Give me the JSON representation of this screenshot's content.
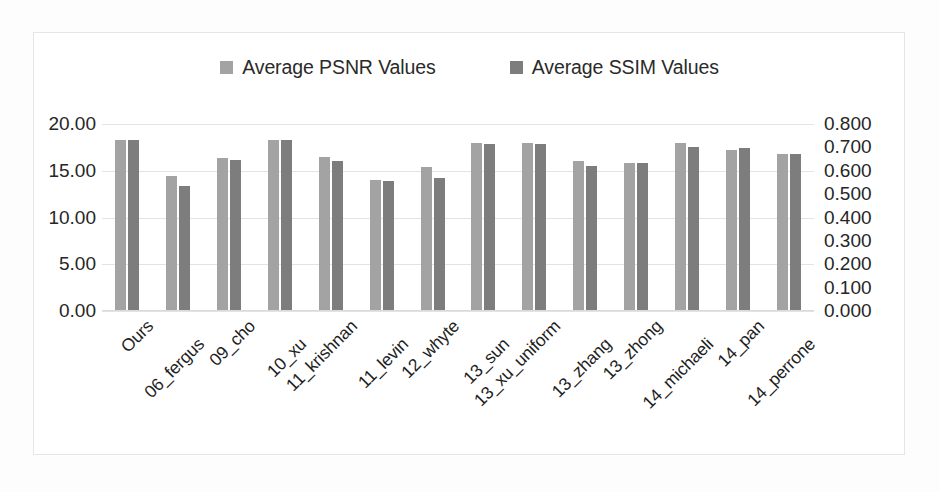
{
  "chart_data": {
    "type": "bar",
    "title": "",
    "subtitle": "",
    "xlabel": "",
    "ylabel": "",
    "y2label": "",
    "grid": true,
    "legend_position": "top-center",
    "categories": [
      "Ours",
      "06_fergus",
      "09_cho",
      "10_xu",
      "11_krishnan",
      "11_levin",
      "12_whyte",
      "13_sun",
      "13_xu_uniform",
      "13_zhang",
      "13_zhong",
      "14_michaeli",
      "14_pan",
      "14_perrone"
    ],
    "series": [
      {
        "name": "Average PSNR Values",
        "axis": "left",
        "color": "#a3a3a3",
        "values": [
          18.3,
          14.4,
          16.4,
          18.3,
          16.45,
          14.05,
          15.4,
          17.95,
          17.95,
          16.0,
          15.8,
          18.0,
          17.2,
          16.8
        ]
      },
      {
        "name": "Average SSIM Values",
        "axis": "right",
        "color": "#7d7d7d",
        "values": [
          0.732,
          0.536,
          0.644,
          0.732,
          0.64,
          0.556,
          0.568,
          0.716,
          0.716,
          0.62,
          0.632,
          0.7,
          0.696,
          0.672
        ]
      }
    ],
    "ylim": [
      0.0,
      20.0
    ],
    "y2lim": [
      0.0,
      0.8
    ],
    "yticks": [
      "0.00",
      "5.00",
      "10.00",
      "15.00",
      "20.00"
    ],
    "ytick_values": [
      0,
      5,
      10,
      15,
      20
    ],
    "y2ticks": [
      "0.000",
      "0.100",
      "0.200",
      "0.300",
      "0.400",
      "0.500",
      "0.600",
      "0.700",
      "0.800"
    ],
    "y2tick_values": [
      0,
      0.1,
      0.2,
      0.3,
      0.4,
      0.5,
      0.6,
      0.7,
      0.8
    ]
  },
  "legend": {
    "entries": [
      {
        "label": "Average PSNR Values",
        "color": "#a3a3a3",
        "icon": "square-swatch-icon"
      },
      {
        "label": "Average SSIM Values",
        "color": "#7d7d7d",
        "icon": "square-swatch-icon"
      }
    ]
  },
  "colors": {
    "background": "#ffffff",
    "frame": "#e6e6e6",
    "gridline": "#e3e3e3",
    "text": "#262626",
    "series_psnr": "#a3a3a3",
    "series_ssim": "#7d7d7d"
  }
}
